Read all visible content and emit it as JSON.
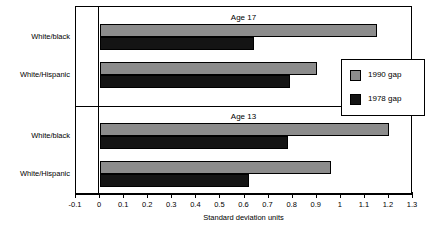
{
  "chart_data": {
    "type": "bar",
    "orientation": "horizontal",
    "title": "",
    "xlabel": "Standard deviation units",
    "ylabel": "",
    "xlim": [
      -0.1,
      1.3
    ],
    "xticks": [
      "-0.1",
      "0",
      "0.1",
      "0.2",
      "0.3",
      "0.4",
      "0.5",
      "0.6",
      "0.7",
      "0.8",
      "0.9",
      "1",
      "1.1",
      "1.2",
      "1.3"
    ],
    "xtick_values": [
      -0.1,
      0,
      0.1,
      0.2,
      0.3,
      0.4,
      0.5,
      0.6,
      0.7,
      0.8,
      0.9,
      1.0,
      1.1,
      1.2,
      1.3
    ],
    "grid": false,
    "legend_position": "center-right",
    "panels": [
      {
        "title": "Age 17",
        "categories": [
          "White/black",
          "White/Hispanic"
        ],
        "series": [
          {
            "name": "1990 gap",
            "color": "#8c8c8c",
            "values": [
              1.15,
              0.9
            ]
          },
          {
            "name": "1978 gap",
            "color": "#141414",
            "values": [
              0.64,
              0.79
            ]
          }
        ]
      },
      {
        "title": "Age 13",
        "categories": [
          "White/black",
          "White/Hispanic"
        ],
        "series": [
          {
            "name": "1990 gap",
            "color": "#8c8c8c",
            "values": [
              1.2,
              0.96
            ]
          },
          {
            "name": "1978 gap",
            "color": "#141414",
            "values": [
              0.78,
              0.62
            ]
          }
        ]
      }
    ],
    "legend": [
      {
        "label": "1990 gap",
        "color": "#8c8c8c"
      },
      {
        "label": "1978 gap",
        "color": "#141414"
      }
    ]
  }
}
